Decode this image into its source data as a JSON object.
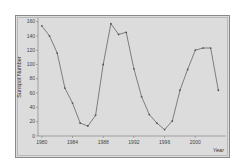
{
  "chart_data": {
    "type": "line",
    "title": "",
    "xlabel": "Year",
    "ylabel": "Sunspot Number",
    "x": [
      1980,
      1981,
      1982,
      1983,
      1984,
      1985,
      1986,
      1987,
      1988,
      1989,
      1990,
      1991,
      1992,
      1993,
      1994,
      1995,
      1996,
      1997,
      1998,
      1999,
      2000,
      2001,
      2002,
      2003
    ],
    "values": [
      154,
      140,
      116,
      67,
      46,
      18,
      14,
      29,
      100,
      157,
      142,
      145,
      94,
      55,
      30,
      18,
      9,
      21,
      64,
      93,
      120,
      123,
      123,
      64
    ],
    "xticks": [
      "1980",
      "1984",
      "1988",
      "1992",
      "1996",
      "2000"
    ],
    "yticks": [
      "0",
      "20",
      "40",
      "60",
      "80",
      "100",
      "120",
      "140",
      "160"
    ],
    "xlim": [
      1979.5,
      2004
    ],
    "ylim": [
      0,
      165
    ],
    "grid": false,
    "legend": null,
    "colors": {
      "line": "#555555",
      "marker": "#555555",
      "plot_bg": "#dcdcdc",
      "frame": "#8a8a8a"
    }
  }
}
